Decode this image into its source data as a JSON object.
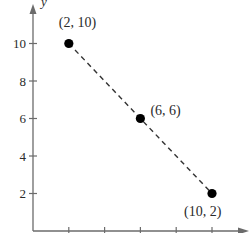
{
  "chart_data": {
    "type": "scatter",
    "title": "",
    "xlabel": "x",
    "ylabel": "y",
    "xlim": [
      0,
      11
    ],
    "ylim": [
      0,
      11
    ],
    "grid": false,
    "x_ticks": [
      2,
      4,
      6,
      8,
      10
    ],
    "y_ticks": [
      2,
      4,
      6,
      8,
      10
    ],
    "y_tick_labels": [
      "2",
      "4",
      "6",
      "8",
      "10"
    ],
    "series": [
      {
        "name": "points",
        "points": [
          {
            "x": 2,
            "y": 10,
            "label": "(2, 10)"
          },
          {
            "x": 6,
            "y": 6,
            "label": "(6, 6)"
          },
          {
            "x": 10,
            "y": 2,
            "label": "(10, 2)"
          }
        ],
        "connector": "dashed line"
      }
    ],
    "colors": {
      "axis": "#6b6b6b",
      "points": "#000000",
      "line": "#333333",
      "text": "#2a2a2a"
    }
  }
}
